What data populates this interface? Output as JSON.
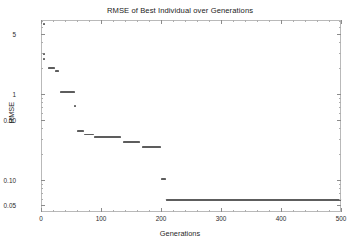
{
  "chart_data": {
    "type": "line",
    "title": "RMSE of Best Individual over Generations",
    "xlabel": "Generations",
    "ylabel": "RMSE",
    "xscale": "linear",
    "yscale": "log",
    "xlim": [
      0,
      500
    ],
    "ylim": [
      0.042,
      7.2
    ],
    "grid": false,
    "legend": null,
    "xticks": [
      0,
      100,
      200,
      300,
      400,
      500
    ],
    "xtick_labels": [
      "0",
      "100",
      "200",
      "300",
      "400",
      "500"
    ],
    "yticks": [
      5,
      1,
      0.5,
      0.1,
      0.05
    ],
    "ytick_labels": [
      "5",
      "1",
      "0.50",
      "0.10",
      "0.05"
    ],
    "series": [
      {
        "name": "Best individual RMSE",
        "color": "#5d5d5d",
        "style": "step-plateaus",
        "description": "Monotonically decreasing best-of-generation RMSE shown as flat plateaus that drop at improvement events",
        "x": [
          2,
          4,
          12,
          16,
          22,
          30,
          38,
          52,
          60,
          88,
          100,
          150,
          160,
          165,
          200,
          205,
          500
        ],
        "y": [
          6.4,
          2.8,
          2.6,
          2.0,
          1.9,
          1.05,
          1.05,
          0.72,
          0.36,
          0.33,
          0.3,
          0.3,
          0.24,
          0.24,
          0.105,
          0.058,
          0.058
        ],
        "plateaus": [
          {
            "x0": 12,
            "x1": 24,
            "value": 2.0
          },
          {
            "x0": 24,
            "x1": 30,
            "value": 1.82
          },
          {
            "x0": 32,
            "x1": 56,
            "value": 1.05
          },
          {
            "x0": 60,
            "x1": 72,
            "value": 0.365
          },
          {
            "x0": 72,
            "x1": 88,
            "value": 0.335
          },
          {
            "x0": 88,
            "x1": 133,
            "value": 0.315
          },
          {
            "x0": 136,
            "x1": 165,
            "value": 0.275
          },
          {
            "x0": 168,
            "x1": 200,
            "value": 0.238
          },
          {
            "x0": 200,
            "x1": 208,
            "value": 0.102
          },
          {
            "x0": 208,
            "x1": 500,
            "value": 0.058
          }
        ],
        "points": [
          {
            "x": 5,
            "y": 6.4
          },
          {
            "x": 5,
            "y": 2.9
          },
          {
            "x": 5,
            "y": 2.55
          },
          {
            "x": 57,
            "y": 0.72
          }
        ]
      }
    ]
  },
  "axes": {
    "x_title": "Generations",
    "y_title": "RMSE"
  },
  "colors": {
    "data": "#5d5d5d",
    "frame": "#b9b9b9",
    "tick": "#8c8c8c",
    "text": "#2b2b2b",
    "background": "#ffffff"
  }
}
